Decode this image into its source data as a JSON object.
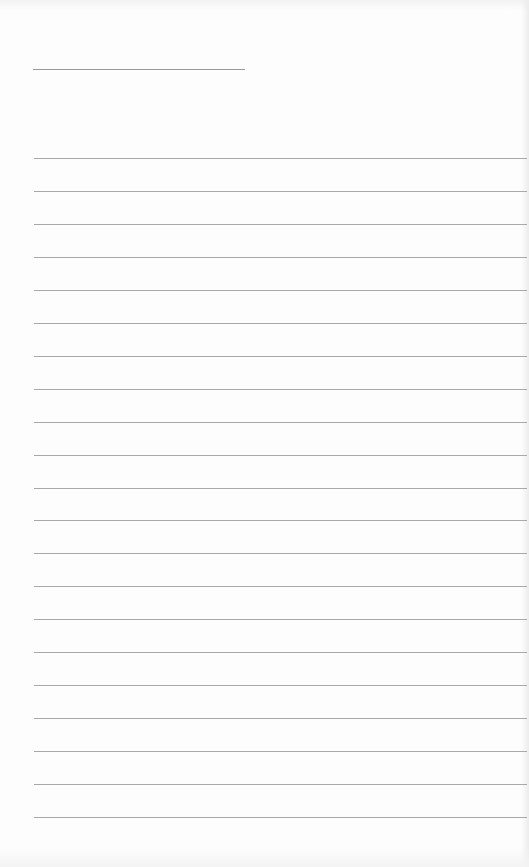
{
  "document": {
    "type": "lined-paper",
    "title_line": {
      "left": 33,
      "top": 69,
      "width": 212
    },
    "ruled_lines": {
      "count": 21,
      "first_top": 158,
      "spacing": 32.95,
      "left": 34
    },
    "colors": {
      "paper": "#fdfdfd",
      "line": "#a8a8a8",
      "title_line": "#9a9a9a"
    }
  }
}
